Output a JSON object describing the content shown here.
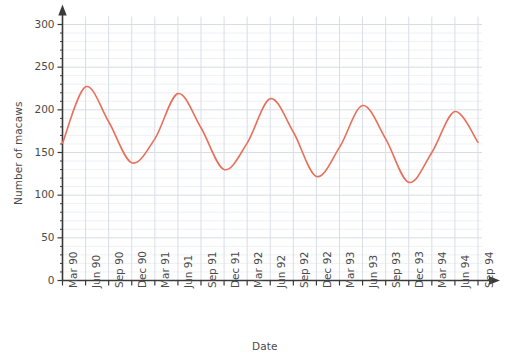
{
  "chart_data": {
    "type": "line",
    "title": "",
    "xlabel": "Date",
    "ylabel": "Number of macaws",
    "ylim": [
      0,
      300
    ],
    "ytick_step": 50,
    "yticks": [
      0,
      50,
      100,
      150,
      200,
      250,
      300
    ],
    "ytick_labels": [
      "0",
      "50",
      "100",
      "150",
      "200",
      "250",
      "300"
    ],
    "minor_y_step": 10,
    "grid": true,
    "grid_minor": true,
    "legend": "none",
    "categories": [
      "Mar 90",
      "Jun 90",
      "Sep 90",
      "Dec 90",
      "Mar 91",
      "Jun 91",
      "Sep 91",
      "Dec 91",
      "Mar 92",
      "Jun 92",
      "Sep 92",
      "Dec 92",
      "Mar 93",
      "Jun 93",
      "Sep 93",
      "Dec 93",
      "Mar 94",
      "Jun 94",
      "Sep 94"
    ],
    "series": [
      {
        "name": "Number of macaws",
        "color": "#e8705a",
        "values": [
          161,
          227,
          186,
          138,
          166,
          219,
          179,
          130,
          161,
          213,
          174,
          122,
          156,
          205,
          166,
          115,
          150,
          198,
          162
        ]
      }
    ],
    "line_color": "#e8705a",
    "line_width": 1.6,
    "axis_color": "#3a3a3a",
    "grid_major_color": "#d8dde6",
    "grid_minor_color": "#eef1f5",
    "background": "#ffffff",
    "annotations": []
  }
}
